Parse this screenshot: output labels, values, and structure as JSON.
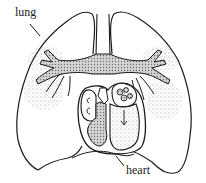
{
  "diagram": {
    "labels": {
      "lung": "lung",
      "heart": "heart"
    },
    "colors": {
      "outline": "#1a1a1a",
      "airway_fill": "#b8b8b8",
      "stipple": "#7a7a7a",
      "background": "#ffffff"
    }
  }
}
